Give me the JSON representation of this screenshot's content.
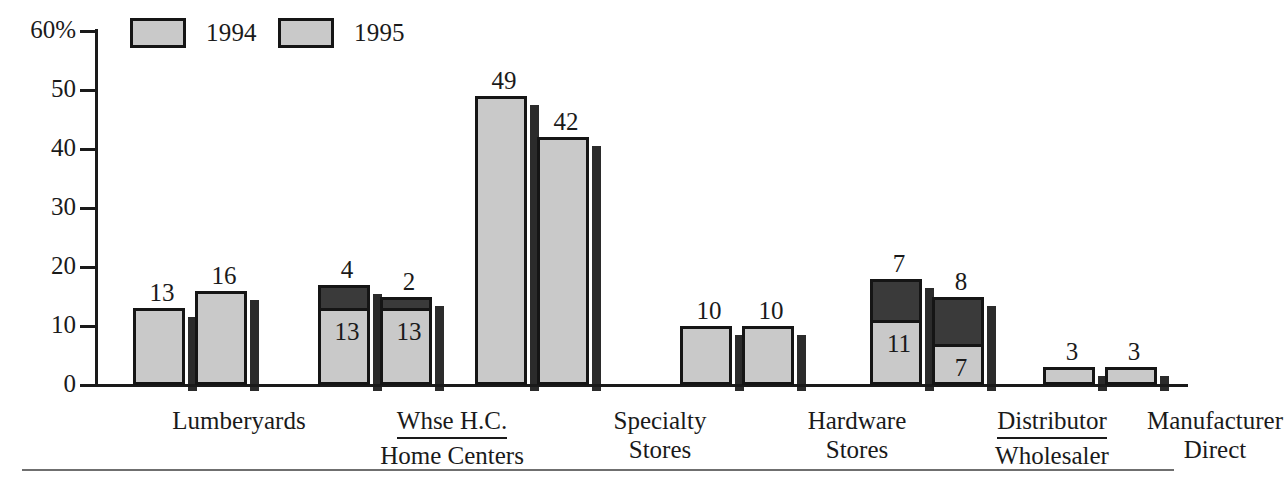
{
  "chart_data": {
    "type": "bar",
    "title": "",
    "xlabel": "",
    "ylabel": "",
    "ylim": [
      0,
      60
    ],
    "grid": false,
    "legend_position": "top-left",
    "y_ticks": [
      "60%",
      "50",
      "40",
      "30",
      "20",
      "10",
      "0"
    ],
    "y_tick_values": [
      60,
      50,
      40,
      30,
      20,
      10,
      0
    ],
    "categories": [
      "Lumberyards",
      "Whse H.C. / Home Centers",
      "Specialty Stores",
      "Hardware Stores",
      "Distributor / Wholesaler",
      "Manufacturer Direct"
    ],
    "series": [
      {
        "name": "1994",
        "values": [
          13,
          13,
          49,
          10,
          11,
          3
        ]
      },
      {
        "name": "1995",
        "values": [
          16,
          13,
          42,
          10,
          7,
          3
        ]
      }
    ],
    "stacked_top_series": [
      {
        "name": "1994-top",
        "values": [
          null,
          4,
          null,
          null,
          7,
          null
        ]
      },
      {
        "name": "1995-top",
        "values": [
          null,
          2,
          null,
          null,
          8,
          null
        ]
      }
    ]
  },
  "legend": {
    "items": [
      {
        "label": "1994",
        "color": "#c9c9c9"
      },
      {
        "label": "1995",
        "color": "#c9c9c9"
      }
    ]
  },
  "axis": {
    "ticks": [
      {
        "label": "60%",
        "value": 60
      },
      {
        "label": "50",
        "value": 50
      },
      {
        "label": "40",
        "value": 40
      },
      {
        "label": "30",
        "value": 30
      },
      {
        "label": "20",
        "value": 20
      },
      {
        "label": "10",
        "value": 10
      },
      {
        "label": "0",
        "value": 0
      }
    ]
  },
  "groups": [
    {
      "name": "lumberyards",
      "label_line1": "Lumberyards",
      "label_line2": "",
      "fraction": false,
      "bars": [
        {
          "series": "1994",
          "base": 13,
          "top": null,
          "base_label": "",
          "top_label": "13"
        },
        {
          "series": "1995",
          "base": 16,
          "top": null,
          "base_label": "",
          "top_label": "16"
        }
      ]
    },
    {
      "name": "whse-home-centers",
      "label_line1": "Whse H.C.",
      "label_line2": "Home Centers",
      "fraction": true,
      "bars": [
        {
          "series": "1994",
          "base": 13,
          "top": 4,
          "base_label": "13",
          "top_label": "4"
        },
        {
          "series": "1995",
          "base": 13,
          "top": 2,
          "base_label": "13",
          "top_label": "2"
        }
      ]
    },
    {
      "name": "specialty-stores",
      "label_line1": "Specialty",
      "label_line2": "Stores",
      "fraction": false,
      "bars": [
        {
          "series": "1994",
          "base": 49,
          "top": null,
          "base_label": "",
          "top_label": "49"
        },
        {
          "series": "1995",
          "base": 42,
          "top": null,
          "base_label": "",
          "top_label": "42"
        }
      ]
    },
    {
      "name": "hardware-stores",
      "label_line1": "Hardware",
      "label_line2": "Stores",
      "fraction": false,
      "bars": [
        {
          "series": "1994",
          "base": 10,
          "top": null,
          "base_label": "",
          "top_label": "10"
        },
        {
          "series": "1995",
          "base": 10,
          "top": null,
          "base_label": "",
          "top_label": "10"
        }
      ]
    },
    {
      "name": "distributor-wholesaler",
      "label_line1": "Distributor",
      "label_line2": "Wholesaler",
      "fraction": true,
      "bars": [
        {
          "series": "1994",
          "base": 11,
          "top": 7,
          "base_label": "11",
          "top_label": "7"
        },
        {
          "series": "1995",
          "base": 7,
          "top": 8,
          "base_label": "7",
          "top_label": "8"
        }
      ]
    },
    {
      "name": "manufacturer-direct",
      "label_line1": "Manufacturer",
      "label_line2": "Direct",
      "fraction": false,
      "bars": [
        {
          "series": "1994",
          "base": 3,
          "top": null,
          "base_label": "",
          "top_label": "3"
        },
        {
          "series": "1995",
          "base": 3,
          "top": null,
          "base_label": "",
          "top_label": "3"
        }
      ]
    }
  ],
  "colors": {
    "light_fill": "#c9c9c9",
    "dark_fill": "#3a3a3a",
    "outline": "#151515",
    "shadow": "#2b2b2b",
    "axis": "#1a1a1a",
    "rule": "#6f6f6f"
  }
}
